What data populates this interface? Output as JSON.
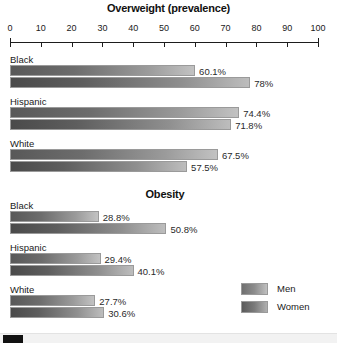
{
  "chart_data": {
    "type": "bar",
    "orientation": "horizontal",
    "title": "Overweight (prevalence)",
    "xlabel": "",
    "ylabel": "",
    "xlim": [
      0,
      100
    ],
    "grid": false,
    "legend_position": "bottom-right",
    "panels": [
      {
        "title": "Overweight (prevalence)",
        "categories": [
          "Black",
          "Hispanic",
          "White"
        ],
        "series": [
          {
            "name": "Men",
            "values": [
              60.1,
              74.4,
              67.5
            ],
            "labels": [
              "60.1%",
              "74.4%",
              "67.5%"
            ]
          },
          {
            "name": "Women",
            "values": [
              78.0,
              71.8,
              57.5
            ],
            "labels": [
              "78%",
              "71.8%",
              "57.5%"
            ]
          }
        ]
      },
      {
        "title": "Obesity",
        "categories": [
          "Black",
          "Hispanic",
          "White"
        ],
        "series": [
          {
            "name": "Men",
            "values": [
              28.8,
              29.4,
              27.7
            ],
            "labels": [
              "28.8%",
              "29.4%",
              "27.7%"
            ]
          },
          {
            "name": "Women",
            "values": [
              50.8,
              40.1,
              30.6
            ],
            "labels": [
              "50.8%",
              "40.1%",
              "30.6%"
            ]
          }
        ]
      }
    ],
    "axis_ticks": [
      {
        "value": 0,
        "label": "0"
      },
      {
        "value": 10,
        "label": "10"
      },
      {
        "value": 20,
        "label": "20"
      },
      {
        "value": 30,
        "label": "30"
      },
      {
        "value": 40,
        "label": "40"
      },
      {
        "value": 50,
        "label": "50"
      },
      {
        "value": 60,
        "label": "60"
      },
      {
        "value": 70,
        "label": "70"
      },
      {
        "value": 80,
        "label": "80"
      },
      {
        "value": 90,
        "label": "90"
      },
      {
        "value": 100,
        "label": "100"
      }
    ],
    "legend": [
      {
        "name": "Men",
        "color": "#8d8d8d"
      },
      {
        "name": "Women",
        "color": "#7b7b7b"
      }
    ],
    "colors": {
      "men_start": "#585858",
      "men_end": "#c2c2c2",
      "women_start": "#4a4a4a",
      "women_end": "#bdbdbd",
      "axis": "#1d1d1d",
      "text": "#1a1a1a",
      "background": "#ffffff"
    }
  },
  "titles": {
    "overweight": "Overweight (prevalence)",
    "obesity": "Obesity"
  },
  "scrollbar": {
    "orientation": "horizontal",
    "thumb_position": "left"
  }
}
